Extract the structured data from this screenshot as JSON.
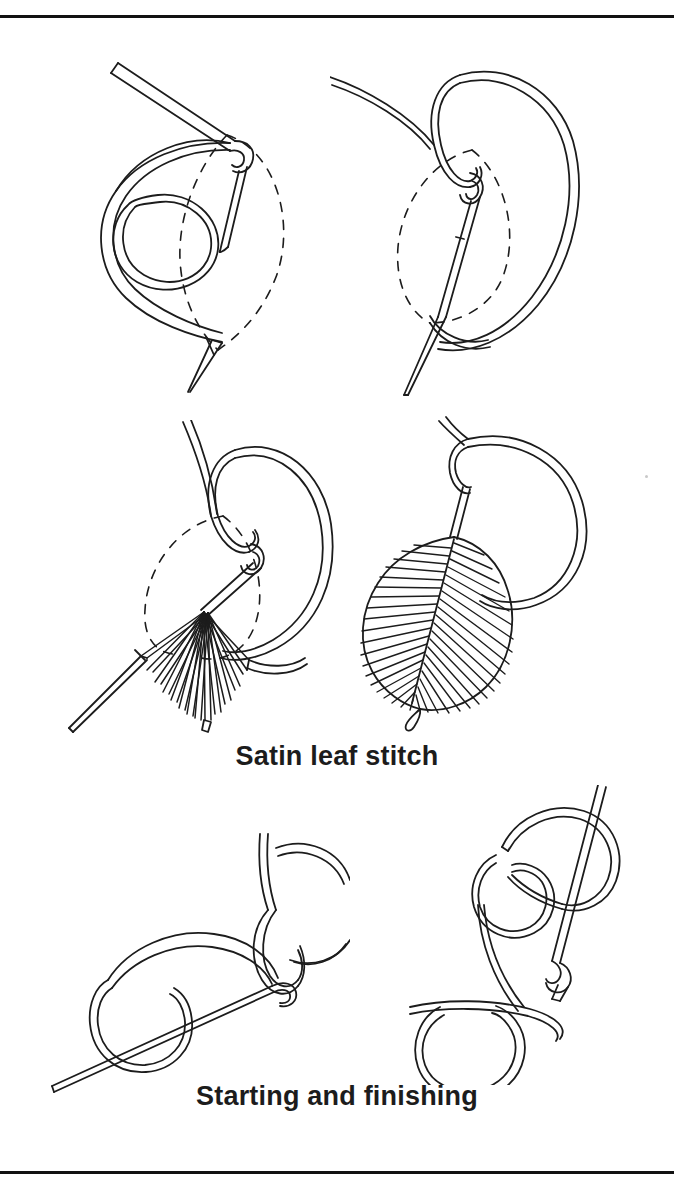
{
  "page": {
    "width": 674,
    "height": 1186,
    "background": "#ffffff",
    "ink": "#1c1c1c",
    "rules": [
      {
        "name": "top-rule",
        "y": 15,
        "thickness": 3,
        "color": "#111111"
      },
      {
        "name": "bottom-rule",
        "y": 1171,
        "thickness": 3,
        "color": "#111111"
      }
    ]
  },
  "captions": {
    "satin": "Satin leaf stitch",
    "starting": "Starting and finishing"
  },
  "figures": [
    {
      "id": "fig-1",
      "name": "satin-leaf-step-1",
      "group": "Satin leaf stitch",
      "step": 1,
      "description": "Needle enters at the leaf tip; working thread forms a loose loop to the left and a small coil; dashed leaf outline shows the shape to be filled.",
      "elements": [
        "needle",
        "thread-loop",
        "thread-coil",
        "dashed-leaf-outline",
        "needle-tip-below"
      ]
    },
    {
      "id": "fig-2",
      "name": "satin-leaf-step-2",
      "group": "Satin leaf stitch",
      "step": 2,
      "description": "Needle is brought down vertically through the centre of the leaf and passes under the looped thread; a large loop of thread swings out to the right.",
      "elements": [
        "needle",
        "thread-loop-large",
        "thread-loop-small",
        "dashed-leaf-outline"
      ]
    },
    {
      "id": "fig-3",
      "name": "satin-leaf-step-3",
      "group": "Satin leaf stitch",
      "step": 3,
      "description": "A fan of worked satin stitches has begun to fill the lower half of the dashed leaf outline; the needle emerges at the lower-left edge.",
      "elements": [
        "needle",
        "thread-loop",
        "stitch-fan",
        "dashed-leaf-outline"
      ],
      "stitch_count": 14
    },
    {
      "id": "fig-4",
      "name": "satin-leaf-step-4",
      "group": "Satin leaf stitch",
      "step": 4,
      "description": "The completed satin leaf: closely packed stitches slant from both sides into a central vein; the thread loop comes off the top of the leaf.",
      "elements": [
        "leaf-filled",
        "central-vein",
        "thread-loop",
        "thread-tail"
      ],
      "stitch_count": 52
    },
    {
      "id": "fig-5",
      "name": "starting-and-finishing-left",
      "group": "Starting and finishing",
      "step": 1,
      "description": "Needle passed from lower left through a loop of thread; a second loop sits over the needle shank near the eye.",
      "elements": [
        "needle",
        "thread-loop-lower",
        "thread-loop-upper",
        "thread-tail"
      ]
    },
    {
      "id": "fig-6",
      "name": "starting-and-finishing-right",
      "group": "Starting and finishing",
      "step": 2,
      "description": "Needle held upright with two interlocking thread loops wrapped around the shank, forming the finishing knot.",
      "elements": [
        "needle",
        "thread-loop-upper",
        "thread-loop-middle",
        "thread-loop-lower",
        "thread-tail"
      ]
    }
  ],
  "marks": [
    {
      "name": "page-speck",
      "x": 645,
      "y": 475
    }
  ]
}
